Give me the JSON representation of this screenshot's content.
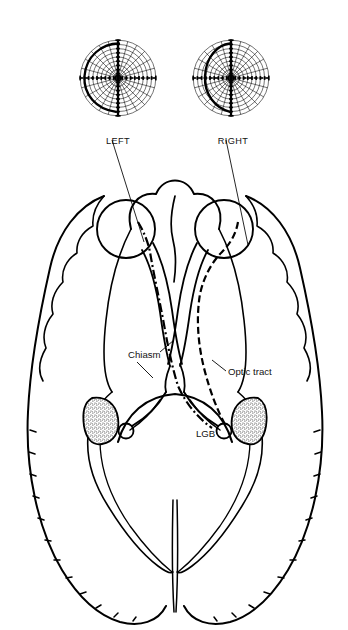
{
  "figure": {
    "type": "anatomical-line-diagram",
    "background_color": "#ffffff",
    "ink_color": "#000000",
    "orientation": "axial / inferior view of brain, anterior at top"
  },
  "field_charts": {
    "label_left": "LEFT",
    "label_right": "RIGHT",
    "count": 2,
    "grid": {
      "meridian_count": 24,
      "ring_count": 9,
      "bold_vertical_meridian": true,
      "bold_horizontal_meridian": true,
      "tick_marks_on_axes": true
    },
    "charts": [
      {
        "eye": "LEFT",
        "fixation_center": true,
        "bold_isopter_side": "temporal",
        "bold_vertical_meridian": true,
        "defect_side": "left"
      },
      {
        "eye": "RIGHT",
        "fixation_center": true,
        "bold_isopter_side": "nasal",
        "bold_vertical_meridian": true,
        "defect_side": "left"
      }
    ]
  },
  "anatomy_labels": {
    "chiasm": "Chiasm",
    "optic_tract": "Optic tract",
    "lgb": "LGB"
  },
  "pathway": {
    "left_eye_trace_style": "dash-dot",
    "right_eye_trace_style": "dashed",
    "crossing_point": "Chiasm",
    "terminus": "LGB"
  },
  "structures": {
    "eyes": 2,
    "frontal_lobes": 2,
    "temporal_lobes": 2,
    "occipital_lobes": 2,
    "lgb_bodies": 2,
    "lgb_fill": "stippled",
    "midline_fissure": true
  }
}
